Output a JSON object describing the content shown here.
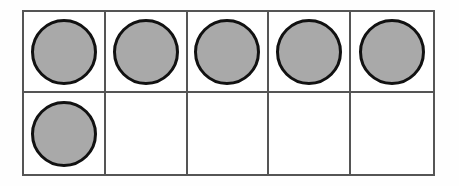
{
  "diagram": {
    "type": "ten-frame",
    "rows": 2,
    "columns": 5,
    "total_cells": 10,
    "filled_count": 6,
    "empty_count": 4,
    "colors": {
      "counter_fill": "#a9a9a9",
      "counter_stroke": "#111111",
      "grid_line": "#555555",
      "frame_background": "#ffffff",
      "page_background": "#fefefe"
    },
    "cells": [
      {
        "row": 1,
        "column": 1,
        "filled": true,
        "counter_label": "counter"
      },
      {
        "row": 1,
        "column": 2,
        "filled": true,
        "counter_label": "counter"
      },
      {
        "row": 1,
        "column": 3,
        "filled": true,
        "counter_label": "counter"
      },
      {
        "row": 1,
        "column": 4,
        "filled": true,
        "counter_label": "counter"
      },
      {
        "row": 1,
        "column": 5,
        "filled": true,
        "counter_label": "counter"
      },
      {
        "row": 2,
        "column": 1,
        "filled": true,
        "counter_label": "counter"
      },
      {
        "row": 2,
        "column": 2,
        "filled": false,
        "counter_label": ""
      },
      {
        "row": 2,
        "column": 3,
        "filled": false,
        "counter_label": ""
      },
      {
        "row": 2,
        "column": 4,
        "filled": false,
        "counter_label": ""
      },
      {
        "row": 2,
        "column": 5,
        "filled": false,
        "counter_label": ""
      }
    ]
  }
}
